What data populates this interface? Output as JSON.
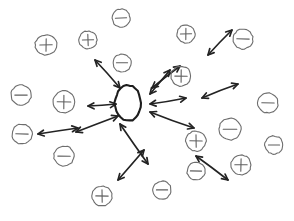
{
  "figure": {
    "background_color": "#ffffff",
    "ink_color": "#232323",
    "particle_outline_color": "#6d6d6d",
    "center_body_color": "#1d1d1d",
    "width": 294,
    "height": 221
  },
  "center_body": {
    "name": "central-neutral-body",
    "label": "",
    "cx": 128,
    "cy": 103,
    "rx": 13,
    "ry": 18
  },
  "particles": [
    {
      "id": "p1",
      "sign": "+",
      "symbol": "+",
      "cx": 46,
      "cy": 45,
      "rx": 11,
      "ry": 10
    },
    {
      "id": "p2",
      "sign": "+",
      "symbol": "+",
      "cx": 88,
      "cy": 40,
      "rx": 9,
      "ry": 9
    },
    {
      "id": "p3",
      "sign": "-",
      "symbol": "−",
      "cx": 121,
      "cy": 18,
      "rx": 9,
      "ry": 9
    },
    {
      "id": "p4",
      "sign": "+",
      "symbol": "+",
      "cx": 186,
      "cy": 34,
      "rx": 9,
      "ry": 9
    },
    {
      "id": "p5",
      "sign": "-",
      "symbol": "−",
      "cx": 243,
      "cy": 39,
      "rx": 10,
      "ry": 10
    },
    {
      "id": "p6",
      "sign": "-",
      "symbol": "−",
      "cx": 122,
      "cy": 63,
      "rx": 9,
      "ry": 9
    },
    {
      "id": "p7",
      "sign": "+",
      "symbol": "+",
      "cx": 181,
      "cy": 76,
      "rx": 10,
      "ry": 10
    },
    {
      "id": "p8",
      "sign": "-",
      "symbol": "−",
      "cx": 21,
      "cy": 95,
      "rx": 10,
      "ry": 10
    },
    {
      "id": "p9",
      "sign": "+",
      "symbol": "+",
      "cx": 64,
      "cy": 102,
      "rx": 11,
      "ry": 11
    },
    {
      "id": "p10",
      "sign": "-",
      "symbol": "−",
      "cx": 268,
      "cy": 103,
      "rx": 10,
      "ry": 10
    },
    {
      "id": "p11",
      "sign": "-",
      "symbol": "−",
      "cx": 22,
      "cy": 134,
      "rx": 10,
      "ry": 10
    },
    {
      "id": "p12",
      "sign": "-",
      "symbol": "−",
      "cx": 64,
      "cy": 156,
      "rx": 10,
      "ry": 10
    },
    {
      "id": "p13",
      "sign": "+",
      "symbol": "+",
      "cx": 196,
      "cy": 141,
      "rx": 10,
      "ry": 10
    },
    {
      "id": "p14",
      "sign": "-",
      "symbol": "−",
      "cx": 230,
      "cy": 129,
      "rx": 11,
      "ry": 11
    },
    {
      "id": "p15",
      "sign": "-",
      "symbol": "−",
      "cx": 274,
      "cy": 145,
      "rx": 9,
      "ry": 9
    },
    {
      "id": "p16",
      "sign": "+",
      "symbol": "+",
      "cx": 241,
      "cy": 165,
      "rx": 10,
      "ry": 10
    },
    {
      "id": "p17",
      "sign": "-",
      "symbol": "−",
      "cx": 196,
      "cy": 171,
      "rx": 9,
      "ry": 9
    },
    {
      "id": "p18",
      "sign": "+",
      "symbol": "+",
      "cx": 102,
      "cy": 196,
      "rx": 10,
      "ry": 10
    },
    {
      "id": "p19",
      "sign": "-",
      "symbol": "−",
      "cx": 162,
      "cy": 190,
      "rx": 9,
      "ry": 9
    }
  ],
  "force_arrows": [
    {
      "id": "a1",
      "x1": 95,
      "y1": 60,
      "x2": 120,
      "y2": 88,
      "heads": "both"
    },
    {
      "id": "a2",
      "x1": 152,
      "y1": 88,
      "x2": 180,
      "y2": 66,
      "heads": "both"
    },
    {
      "id": "a3",
      "x1": 208,
      "y1": 55,
      "x2": 232,
      "y2": 30,
      "heads": "both"
    },
    {
      "id": "a4",
      "x1": 88,
      "y1": 106,
      "x2": 116,
      "y2": 104,
      "heads": "both"
    },
    {
      "id": "a5",
      "x1": 150,
      "y1": 104,
      "x2": 186,
      "y2": 98,
      "heads": "both"
    },
    {
      "id": "a6",
      "x1": 202,
      "y1": 98,
      "x2": 238,
      "y2": 84,
      "heads": "both"
    },
    {
      "id": "a7",
      "x1": 150,
      "y1": 112,
      "x2": 194,
      "y2": 128,
      "heads": "both"
    },
    {
      "id": "a8",
      "x1": 76,
      "y1": 132,
      "x2": 118,
      "y2": 116,
      "heads": "both"
    },
    {
      "id": "a9",
      "x1": 38,
      "y1": 134,
      "x2": 78,
      "y2": 128,
      "heads": "both"
    },
    {
      "id": "a10",
      "x1": 120,
      "y1": 124,
      "x2": 148,
      "y2": 164,
      "heads": "both"
    },
    {
      "id": "a11",
      "x1": 118,
      "y1": 180,
      "x2": 144,
      "y2": 150,
      "heads": "both"
    },
    {
      "id": "a12",
      "x1": 196,
      "y1": 156,
      "x2": 228,
      "y2": 180,
      "heads": "both"
    },
    {
      "id": "a13",
      "x1": 170,
      "y1": 70,
      "x2": 150,
      "y2": 94,
      "heads": "both"
    }
  ],
  "legend": {
    "positive_label": "+",
    "negative_label": "−",
    "neutral_label": ""
  },
  "chart_data": {
    "type": "scatter",
    "xlabel": "",
    "ylabel": "",
    "xlim": [
      0,
      294
    ],
    "ylim": [
      0,
      221
    ],
    "grid": false,
    "legend_position": "none",
    "series": [
      {
        "name": "Positive charges",
        "symbol": "+",
        "count": 8,
        "x": [
          46,
          88,
          186,
          181,
          64,
          196,
          241,
          102
        ],
        "y": [
          45,
          40,
          34,
          76,
          102,
          141,
          165,
          196
        ]
      },
      {
        "name": "Negative charges",
        "symbol": "−",
        "count": 11,
        "x": [
          121,
          243,
          122,
          21,
          268,
          22,
          64,
          230,
          274,
          196,
          162
        ],
        "y": [
          18,
          39,
          63,
          95,
          103,
          134,
          156,
          129,
          145,
          171,
          190
        ]
      },
      {
        "name": "Central neutral body",
        "symbol": "oval",
        "count": 1,
        "x": [
          128
        ],
        "y": [
          103
        ]
      }
    ],
    "annotations": [
      "13 double-headed force arrows radiate outward from the central oval body"
    ]
  }
}
